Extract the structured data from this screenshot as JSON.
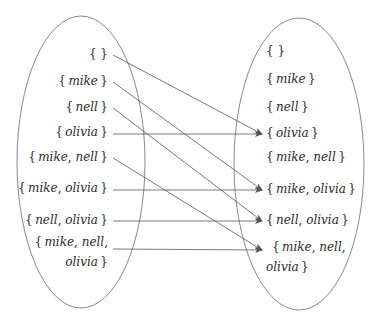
{
  "diagram": {
    "type": "function-mapping",
    "colors": {
      "stroke": "#7a7a7a",
      "text": "#2a2a2a",
      "arrow": "#555555"
    },
    "domain_set": {
      "elements": [
        {
          "id": "d0",
          "label": "{}",
          "lines": [
            "{}"
          ],
          "x": 108,
          "y": 55
        },
        {
          "id": "d1",
          "label": "{mike}",
          "lines": [
            "{mike}"
          ],
          "x": 108,
          "y": 82
        },
        {
          "id": "d2",
          "label": "{nell}",
          "lines": [
            "{nell}"
          ],
          "x": 108,
          "y": 108
        },
        {
          "id": "d3",
          "label": "{olivia}",
          "lines": [
            "{olivia}"
          ],
          "x": 108,
          "y": 133
        },
        {
          "id": "d4",
          "label": "{mike, nell}",
          "lines": [
            "{mike, nell}"
          ],
          "x": 108,
          "y": 158
        },
        {
          "id": "d5",
          "label": "{mike, olivia}",
          "lines": [
            "{mike, olivia}"
          ],
          "x": 108,
          "y": 189
        },
        {
          "id": "d6",
          "label": "{nell, olivia}",
          "lines": [
            "{nell, olivia}"
          ],
          "x": 108,
          "y": 221
        },
        {
          "id": "d7",
          "label": "{mike, nell, olivia}",
          "lines": [
            "{mike, nell,",
            "olivia}"
          ],
          "x": 108,
          "y": 243
        }
      ]
    },
    "codomain_set": {
      "elements": [
        {
          "id": "c0",
          "label": "{}",
          "lines": [
            "{}"
          ],
          "x": 266,
          "y": 52
        },
        {
          "id": "c1",
          "label": "{mike}",
          "lines": [
            "{mike}"
          ],
          "x": 266,
          "y": 80
        },
        {
          "id": "c2",
          "label": "{nell}",
          "lines": [
            "{nell}"
          ],
          "x": 266,
          "y": 108
        },
        {
          "id": "c3",
          "label": "{olivia}",
          "lines": [
            "{olivia}"
          ],
          "x": 266,
          "y": 134
        },
        {
          "id": "c4",
          "label": "{mike, nell}",
          "lines": [
            "{mike, nell}"
          ],
          "x": 266,
          "y": 158
        },
        {
          "id": "c5",
          "label": "{mike, olivia}",
          "lines": [
            "{mike, olivia}"
          ],
          "x": 266,
          "y": 190
        },
        {
          "id": "c6",
          "label": "{nell, olivia}",
          "lines": [
            "{nell, olivia}"
          ],
          "x": 266,
          "y": 221
        },
        {
          "id": "c7",
          "label": "{mike, nell, olivia}",
          "lines": [
            "{mike, nell,",
            "olivia}"
          ],
          "x": 272,
          "y": 248
        }
      ]
    },
    "arrows": [
      {
        "from": "{}",
        "to": "{olivia}",
        "x1": 113,
        "y1": 55,
        "x2": 262,
        "y2": 134
      },
      {
        "from": "{mike}",
        "to": "{mike, olivia}",
        "x1": 113,
        "y1": 82,
        "x2": 262,
        "y2": 190
      },
      {
        "from": "{nell}",
        "to": "{nell, olivia}",
        "x1": 113,
        "y1": 108,
        "x2": 262,
        "y2": 221
      },
      {
        "from": "{olivia}",
        "to": "{olivia}",
        "x1": 113,
        "y1": 134,
        "x2": 262,
        "y2": 134
      },
      {
        "from": "{mike, nell}",
        "to": "{mike, nell, olivia}",
        "x1": 113,
        "y1": 158,
        "x2": 262,
        "y2": 250
      },
      {
        "from": "{mike, olivia}",
        "to": "{mike, olivia}",
        "x1": 113,
        "y1": 190,
        "x2": 262,
        "y2": 190
      },
      {
        "from": "{nell, olivia}",
        "to": "{nell, olivia}",
        "x1": 113,
        "y1": 221,
        "x2": 262,
        "y2": 221
      },
      {
        "from": "{mike, nell, olivia}",
        "to": "{mike, nell, olivia}",
        "x1": 113,
        "y1": 249,
        "x2": 262,
        "y2": 250
      }
    ],
    "ellipses": [
      {
        "name": "domain-ellipse",
        "cx": 81,
        "cy": 162,
        "rx": 64,
        "ry": 146
      },
      {
        "name": "codomain-ellipse",
        "cx": 299,
        "cy": 164,
        "rx": 65,
        "ry": 146
      }
    ]
  }
}
